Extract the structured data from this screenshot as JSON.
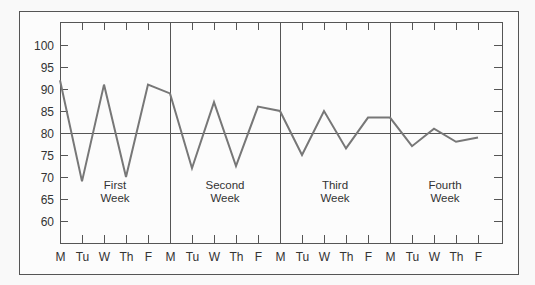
{
  "chart_data": {
    "type": "line",
    "title": "",
    "xlabel": "",
    "ylabel": "",
    "ylim": [
      55,
      105
    ],
    "yticks": [
      60,
      65,
      70,
      75,
      80,
      85,
      90,
      95,
      100
    ],
    "grid": false,
    "legend": null,
    "reference_line": {
      "y": 80
    },
    "x": [
      "M",
      "Tu",
      "W",
      "Th",
      "F",
      "M",
      "Tu",
      "W",
      "Th",
      "F",
      "M",
      "Tu",
      "W",
      "Th",
      "F",
      "M",
      "Tu",
      "W",
      "Th",
      "F"
    ],
    "series": [
      {
        "name": "value",
        "values": [
          92,
          69,
          91,
          70,
          91,
          89,
          72,
          87,
          72.5,
          86,
          85,
          75,
          85,
          76.5,
          83.5,
          83.5,
          77,
          81,
          78,
          79
        ]
      }
    ],
    "week_labels": [
      {
        "line1": "First",
        "line2": "Week"
      },
      {
        "line1": "Second",
        "line2": "Week"
      },
      {
        "line1": "Third",
        "line2": "Week"
      },
      {
        "line1": "Fourth",
        "line2": "Week"
      }
    ],
    "colors": {
      "frame": "#555555",
      "line": "#777777",
      "text": "#333333",
      "background": "#f9f9f9"
    }
  }
}
